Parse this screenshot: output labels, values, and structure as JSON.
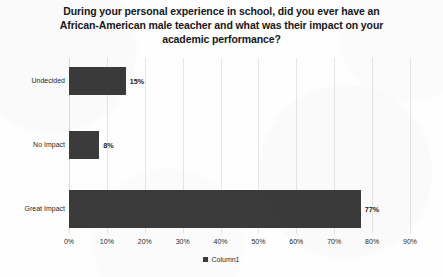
{
  "chart_data": {
    "type": "bar",
    "orientation": "horizontal",
    "title": "During your personal experience in school, did you ever have an African-American male teacher and what was their impact on your academic performance?",
    "title_lines": [
      "During your personal experience in school, did you ever have an",
      "African-American male teacher and what was their impact on your",
      "academic performance?"
    ],
    "categories": [
      "Undecided",
      "No Impact",
      "Great Impact"
    ],
    "values": [
      15,
      8,
      77
    ],
    "data_labels": [
      "15%",
      "8%",
      "77%"
    ],
    "xlabel": "",
    "ylabel": "",
    "xlim": [
      0,
      90
    ],
    "xtick_step": 10,
    "xticks": [
      "0%",
      "10%",
      "20%",
      "30%",
      "40%",
      "50%",
      "60%",
      "70%",
      "80%",
      "90%"
    ],
    "grid": "vertical",
    "legend": {
      "position": "bottom",
      "entries": [
        {
          "name": "Column1",
          "color": "#3b3b3b"
        }
      ]
    },
    "series": [
      {
        "name": "Column1",
        "values": [
          15,
          8,
          77
        ],
        "color": "#3b3b3b"
      }
    ],
    "colors": {
      "bar": "#3b3b3b",
      "gridline": "#e6e6e6",
      "text": "#2a2a2a",
      "title": "#16181a",
      "background": "#fefefe"
    }
  }
}
